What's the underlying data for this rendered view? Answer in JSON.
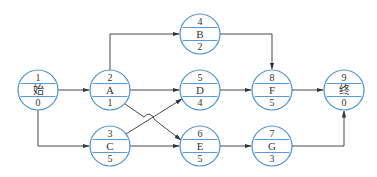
{
  "diagram": {
    "type": "activity-on-node network",
    "colors": {
      "node_stroke": "#4a90d0",
      "edge": "#333333",
      "text": "#333333"
    },
    "nodes": [
      {
        "id": "start",
        "number": "1",
        "name": "始",
        "duration": "0",
        "cx": 38,
        "cy": 90
      },
      {
        "id": "A",
        "number": "2",
        "name": "A",
        "duration": "1",
        "cx": 110,
        "cy": 90
      },
      {
        "id": "C",
        "number": "3",
        "name": "C",
        "duration": "5",
        "cx": 110,
        "cy": 146
      },
      {
        "id": "B",
        "number": "4",
        "name": "B",
        "duration": "2",
        "cx": 200,
        "cy": 34
      },
      {
        "id": "D",
        "number": "5",
        "name": "D",
        "duration": "4",
        "cx": 200,
        "cy": 90
      },
      {
        "id": "E",
        "number": "6",
        "name": "E",
        "duration": "5",
        "cx": 200,
        "cy": 146
      },
      {
        "id": "G",
        "number": "7",
        "name": "G",
        "duration": "3",
        "cx": 272,
        "cy": 146
      },
      {
        "id": "F",
        "number": "8",
        "name": "F",
        "duration": "5",
        "cx": 272,
        "cy": 90
      },
      {
        "id": "end",
        "number": "9",
        "name": "终",
        "duration": "0",
        "cx": 344,
        "cy": 90
      }
    ],
    "edges": [
      {
        "from": "start",
        "to": "A"
      },
      {
        "from": "start",
        "to": "C"
      },
      {
        "from": "A",
        "to": "B"
      },
      {
        "from": "A",
        "to": "D"
      },
      {
        "from": "A",
        "to": "E"
      },
      {
        "from": "C",
        "to": "D"
      },
      {
        "from": "C",
        "to": "E"
      },
      {
        "from": "B",
        "to": "F"
      },
      {
        "from": "D",
        "to": "F"
      },
      {
        "from": "E",
        "to": "G"
      },
      {
        "from": "F",
        "to": "end"
      },
      {
        "from": "G",
        "to": "end"
      }
    ]
  }
}
